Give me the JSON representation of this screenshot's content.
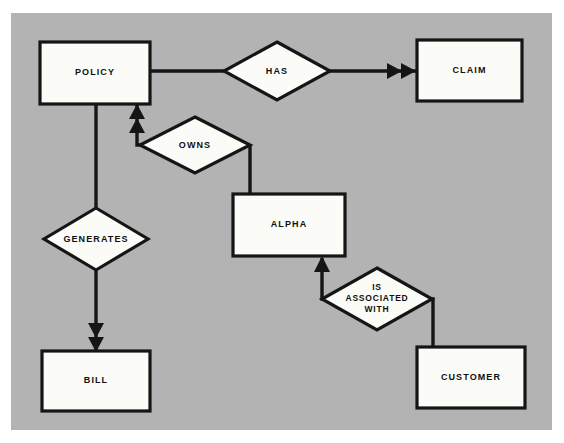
{
  "diagram": {
    "type": "entity-relationship-diagram",
    "title": "",
    "background_color": "#b3b3b3",
    "page_color": "#ffffff",
    "shape_fill_color": "#fbfbf8",
    "line_color": "#151515",
    "entities": [
      {
        "id": "policy",
        "label": "POLICY",
        "x": 40,
        "y": 42,
        "w": 110,
        "h": 62
      },
      {
        "id": "claim",
        "label": "CLAIM",
        "x": 417,
        "y": 40,
        "w": 105,
        "h": 61
      },
      {
        "id": "alpha",
        "label": "ALPHA",
        "x": 233,
        "y": 194,
        "w": 112,
        "h": 62
      },
      {
        "id": "bill",
        "label": "BILL",
        "x": 42,
        "y": 351,
        "w": 108,
        "h": 60
      },
      {
        "id": "customer",
        "label": "CUSTOMER",
        "x": 417,
        "y": 347,
        "w": 108,
        "h": 61
      }
    ],
    "relationships": [
      {
        "id": "has",
        "label": "HAS",
        "lines": [
          "HAS"
        ],
        "cx": 277,
        "cy": 71,
        "rx": 53,
        "ry": 29
      },
      {
        "id": "owns",
        "label": "OWNS",
        "lines": [
          "OWNS"
        ],
        "cx": 195,
        "cy": 145,
        "rx": 55,
        "ry": 28
      },
      {
        "id": "generates",
        "label": "GENERATES",
        "lines": [
          "GENERATES"
        ],
        "cx": 96,
        "cy": 239,
        "rx": 52,
        "ry": 31
      },
      {
        "id": "associated",
        "label": "IS ASSOCIATED WITH",
        "lines": [
          "IS",
          "ASSOCIATED",
          "WITH"
        ],
        "cx": 377,
        "cy": 299,
        "rx": 55,
        "ry": 31
      }
    ],
    "connections": [
      {
        "id": "policy-has",
        "from": "policy",
        "to": "has",
        "arrow": "none"
      },
      {
        "id": "has-claim",
        "from": "has",
        "to": "claim",
        "arrow": "double"
      },
      {
        "id": "owns-policy",
        "from": "owns",
        "to": "policy",
        "arrow": "double"
      },
      {
        "id": "owns-alpha",
        "from": "owns",
        "to": "alpha",
        "arrow": "none"
      },
      {
        "id": "policy-generates",
        "from": "policy",
        "to": "generates",
        "arrow": "none"
      },
      {
        "id": "generates-bill",
        "from": "generates",
        "to": "bill",
        "arrow": "double"
      },
      {
        "id": "associated-alpha",
        "from": "associated",
        "to": "alpha",
        "arrow": "single"
      },
      {
        "id": "customer-associated",
        "from": "customer",
        "to": "associated",
        "arrow": "none"
      }
    ]
  }
}
